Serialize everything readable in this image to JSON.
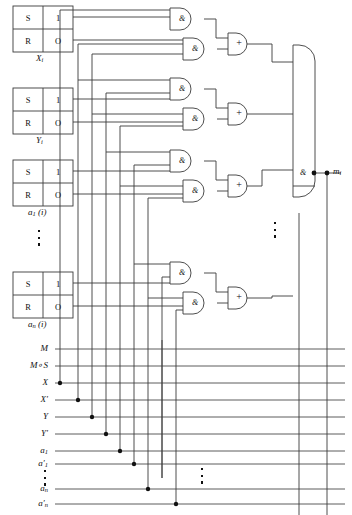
{
  "diagram": {
    "output_label": "m",
    "output_sub": "i",
    "flipflops": [
      {
        "cells": [
          "S",
          "1",
          "R",
          "O"
        ],
        "label": "X",
        "sub": "i",
        "suffix": ""
      },
      {
        "cells": [
          "S",
          "1",
          "R",
          "O"
        ],
        "label": "Y",
        "sub": "i",
        "suffix": ""
      },
      {
        "cells": [
          "S",
          "1",
          "R",
          "O"
        ],
        "label": "a",
        "sub": "1",
        "suffix": " (i)"
      },
      {
        "cells": [
          "S",
          "1",
          "R",
          "O"
        ],
        "label": "a",
        "sub": "n",
        "suffix": " (i)"
      }
    ],
    "and_gate_symbol": "&",
    "or_gate_symbol": "+",
    "big_gate_symbol": "&",
    "bus_lines": [
      {
        "label": "M",
        "sub": ""
      },
      {
        "label": "M∘S",
        "sub": ""
      },
      {
        "label": "X",
        "sub": ""
      },
      {
        "label": "X′",
        "sub": ""
      },
      {
        "label": "Y",
        "sub": ""
      },
      {
        "label": "Y′",
        "sub": ""
      },
      {
        "label": "a",
        "sub": "1"
      },
      {
        "label": "a′",
        "sub": "1"
      },
      {
        "label": "a",
        "sub": "n"
      },
      {
        "label": "a′",
        "sub": "n"
      }
    ],
    "ellipsis_marker": "⋮",
    "colors": {
      "line": "#3a3a3a",
      "dot": "#111111",
      "background": "#ffffff"
    }
  }
}
